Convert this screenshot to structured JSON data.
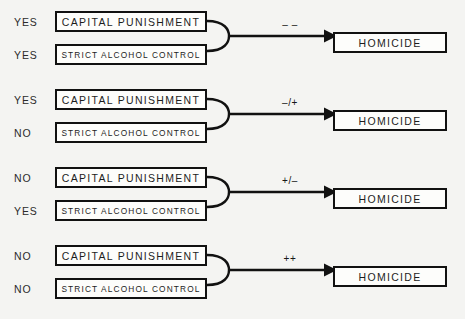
{
  "diagram": {
    "cause_labels": {
      "top": "CAPITAL PUNISHMENT",
      "bottom": "STRICT ALCOHOL CONTROL"
    },
    "effect_label": "HOMICIDE",
    "answers": {
      "yes": "YES",
      "no": "NO"
    },
    "colors": {
      "background": "#f4f4f2",
      "box_fill": "#fdfdfb",
      "stroke": "#111111",
      "text": "#1d1d1d"
    },
    "groups": [
      {
        "id": "group-1",
        "top_answer": "YES",
        "bottom_answer": "YES",
        "top_cause": "CAPITAL PUNISHMENT",
        "bottom_cause": "STRICT ALCOHOL CONTROL",
        "arrow_label": "– –",
        "effect": "HOMICIDE"
      },
      {
        "id": "group-2",
        "top_answer": "YES",
        "bottom_answer": "NO",
        "top_cause": "CAPITAL PUNISHMENT",
        "bottom_cause": "STRICT ALCOHOL CONTROL",
        "arrow_label": "–/+",
        "effect": "HOMICIDE"
      },
      {
        "id": "group-3",
        "top_answer": "NO",
        "bottom_answer": "YES",
        "top_cause": "CAPITAL PUNISHMENT",
        "bottom_cause": "STRICT ALCOHOL CONTROL",
        "arrow_label": "+/–",
        "effect": "HOMICIDE"
      },
      {
        "id": "group-4",
        "top_answer": "NO",
        "bottom_answer": "NO",
        "top_cause": "CAPITAL PUNISHMENT",
        "bottom_cause": "STRICT ALCOHOL CONTROL",
        "arrow_label": "++",
        "effect": "HOMICIDE"
      }
    ]
  }
}
